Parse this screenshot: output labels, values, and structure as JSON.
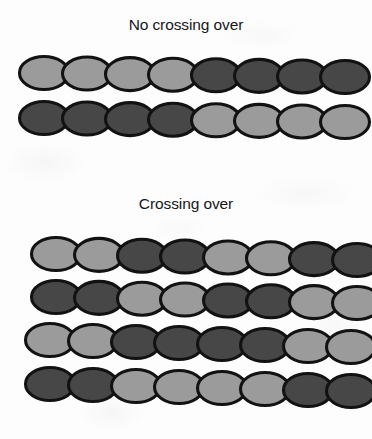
{
  "figure": {
    "type": "biology-diagram",
    "background_color": "#fdfdfd"
  },
  "colors": {
    "light_bead": "#9b9b9b",
    "dark_bead": "#474747",
    "outline": "#121212",
    "text": "#16161a"
  },
  "sections": [
    {
      "id": "no-crossing-over",
      "title": "No crossing over",
      "chromatids": [
        {
          "id": "chromatid-1",
          "beads": [
            "light",
            "light",
            "light",
            "light",
            "dark",
            "dark",
            "dark",
            "dark"
          ]
        },
        {
          "id": "chromatid-2",
          "beads": [
            "dark",
            "dark",
            "dark",
            "dark",
            "light",
            "light",
            "light",
            "light"
          ]
        }
      ]
    },
    {
      "id": "crossing-over",
      "title": "Crossing over",
      "chromatids": [
        {
          "id": "chromatid-3",
          "beads": [
            "light",
            "light",
            "dark",
            "dark",
            "light",
            "light",
            "dark",
            "dark"
          ]
        },
        {
          "id": "chromatid-4",
          "beads": [
            "dark",
            "dark",
            "light",
            "light",
            "dark",
            "dark",
            "light",
            "light"
          ]
        },
        {
          "id": "chromatid-5",
          "beads": [
            "light",
            "light",
            "dark",
            "dark",
            "dark",
            "dark",
            "light",
            "light"
          ]
        },
        {
          "id": "chromatid-6",
          "beads": [
            "dark",
            "dark",
            "light",
            "light",
            "light",
            "light",
            "dark",
            "dark"
          ]
        }
      ]
    }
  ],
  "geometry": {
    "bead_rx": 24.5,
    "bead_ry": 16.5,
    "bead_step": 43.0,
    "rows": [
      {
        "id": "chromatid-1",
        "x0": 44,
        "y0": 73,
        "tilt": 4
      },
      {
        "id": "chromatid-2",
        "x0": 44,
        "y0": 118,
        "tilt": 4
      },
      {
        "id": "chromatid-3",
        "x0": 56,
        "y0": 254,
        "tilt": 6
      },
      {
        "id": "chromatid-4",
        "x0": 56,
        "y0": 297,
        "tilt": 6
      },
      {
        "id": "chromatid-5",
        "x0": 50,
        "y0": 340,
        "tilt": 7
      },
      {
        "id": "chromatid-6",
        "x0": 50,
        "y0": 384,
        "tilt": 7
      }
    ]
  }
}
